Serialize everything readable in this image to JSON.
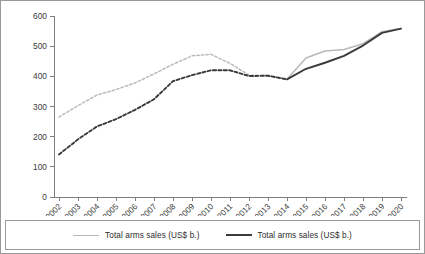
{
  "chart_data": {
    "type": "line",
    "title": "",
    "subtitle": "",
    "xlabel": "",
    "ylabel": "",
    "grid": false,
    "legend_position": "bottom",
    "categories": [
      "2002",
      "2003",
      "2004",
      "2005",
      "2006",
      "2007",
      "2008",
      "2009",
      "2010",
      "2011",
      "2012",
      "2013",
      "2014",
      "2015",
      "2016",
      "2017",
      "2018",
      "2019",
      "2020"
    ],
    "x": [
      2002,
      2003,
      2004,
      2005,
      2006,
      2007,
      2008,
      2009,
      2010,
      2011,
      2012,
      2013,
      2014,
      2015,
      2016,
      2017,
      2018,
      2019,
      2020
    ],
    "xlim": [
      2002,
      2020
    ],
    "ylim": [
      0,
      600
    ],
    "ytick_labels": [
      "0",
      "100",
      "200",
      "300",
      "400",
      "500",
      "600"
    ],
    "ytick_values": [
      0,
      100,
      200,
      300,
      400,
      500,
      600
    ],
    "series": [
      {
        "name": "Total arms sales (US$ b.)",
        "color": "#b9b9b9",
        "style": "dashed-then-solid",
        "solid_from": 2014,
        "values": [
          265,
          303,
          338,
          356,
          378,
          408,
          440,
          468,
          473,
          443,
          404,
          403,
          390,
          461,
          484,
          489,
          508,
          548,
          559
        ]
      },
      {
        "name": "Total arms sales (US$ b.)",
        "color": "#3a3a3a",
        "style": "dashed-then-solid",
        "solid_from": 2014,
        "values": [
          141,
          191,
          234,
          258,
          289,
          324,
          384,
          404,
          420,
          420,
          401,
          402,
          390,
          425,
          445,
          468,
          502,
          544,
          558
        ]
      }
    ]
  },
  "legend": {
    "entries": [
      {
        "label": "Total arms sales (US$ b.)",
        "swatch": "light"
      },
      {
        "label": "Total arms sales (US$ b.)",
        "swatch": "dark"
      }
    ]
  }
}
